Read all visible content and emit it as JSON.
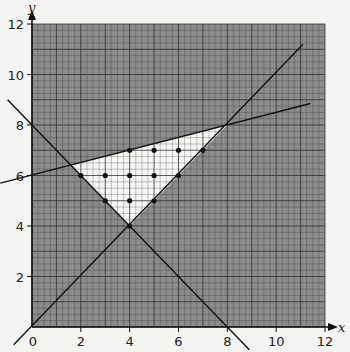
{
  "chart_data": {
    "type": "scatter",
    "title": "",
    "xlabel": "x",
    "ylabel": "y",
    "xlim": [
      0,
      12
    ],
    "ylim": [
      0,
      12
    ],
    "grid": true,
    "grid_minor_step": 0.25,
    "grid_major_step": 1,
    "x_ticks": [
      0,
      2,
      4,
      6,
      8,
      10,
      12
    ],
    "y_ticks": [
      2,
      4,
      6,
      8,
      10,
      12
    ],
    "x_tick_labels": [
      "0",
      "2",
      "4",
      "6",
      "8",
      "10",
      "12"
    ],
    "y_tick_labels": [
      "2",
      "4",
      "6",
      "8",
      "10",
      "12"
    ],
    "lines": [
      {
        "name": "y = x",
        "from": [
          -0.75,
          -0.7
        ],
        "to": [
          11.1,
          11.2
        ]
      },
      {
        "name": "x + y = 8",
        "from": [
          -1.0,
          9.0
        ],
        "to": [
          8.9,
          -0.9
        ]
      },
      {
        "name": "y = x/4 + 6",
        "from": [
          -1.3,
          5.7
        ],
        "to": [
          11.4,
          8.85
        ]
      }
    ],
    "feasible_region": {
      "vertices": [
        [
          1.6,
          6.4
        ],
        [
          8,
          8
        ],
        [
          4,
          4
        ]
      ],
      "fill": "unshaded (white)"
    },
    "lattice_points": [
      [
        4,
        7
      ],
      [
        5,
        7
      ],
      [
        6,
        7
      ],
      [
        7,
        7
      ],
      [
        2,
        6
      ],
      [
        3,
        6
      ],
      [
        4,
        6
      ],
      [
        5,
        6
      ],
      [
        6,
        6
      ],
      [
        3,
        5
      ],
      [
        4,
        5
      ],
      [
        5,
        5
      ],
      [
        4,
        4
      ]
    ],
    "colors": {
      "shaded": "#8c8c8c",
      "feasible": "#f6f6f4",
      "grid": "#2a2a2a",
      "line": "#111111",
      "point": "#111111"
    }
  }
}
